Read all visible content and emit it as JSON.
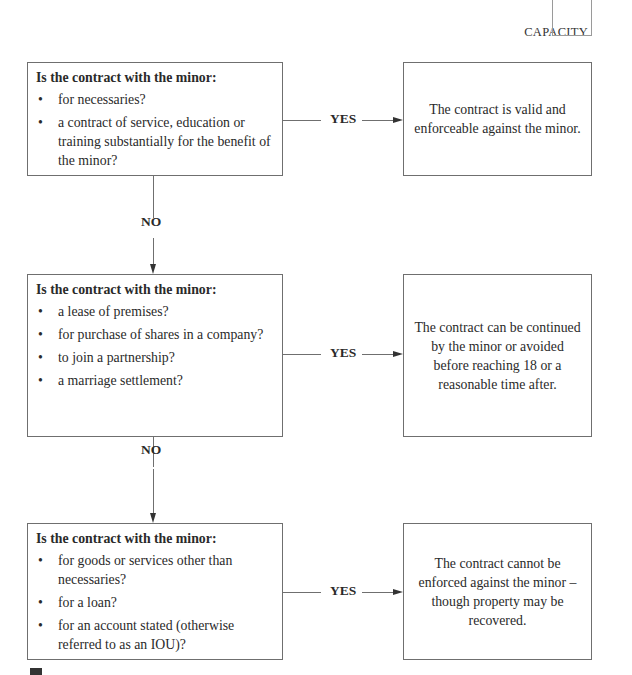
{
  "header": {
    "section_label": "CAPACITY"
  },
  "flow": {
    "question_title": "Is the contract with the minor:",
    "yes_label": "YES",
    "no_label": "NO",
    "steps": [
      {
        "question_title": "Is the contract with the minor:",
        "items": [
          "for necessaries?",
          "a contract of service, education or training substantially for the benefit of the minor?"
        ],
        "outcome": "The contract is valid and enforceable against the minor."
      },
      {
        "question_title": "Is the contract with the minor:",
        "items": [
          "a lease of premises?",
          "for purchase of shares in a company?",
          "to join a partnership?",
          "a marriage settlement?"
        ],
        "outcome": "The contract can be continued by the minor or avoided before reaching 18 or a reasonable time after."
      },
      {
        "question_title": "Is the contract with the minor:",
        "items": [
          "for goods or services other than necessaries?",
          "for a loan?",
          "for an account stated (otherwise referred to as an IOU)?"
        ],
        "outcome": "The contract cannot be enforced against the minor – though property may be recovered."
      }
    ]
  },
  "colors": {
    "line": "#6f6f6f",
    "text": "#2a2a2a"
  }
}
